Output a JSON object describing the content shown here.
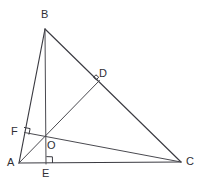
{
  "figure": {
    "canvas": {
      "width": 206,
      "height": 186,
      "background": "#ffffff"
    },
    "stroke_color": "#3b3b42",
    "label_color": "#2f2f35",
    "points": {
      "A": {
        "label": "A",
        "x": 19,
        "y": 163,
        "label_x": 7,
        "label_y": 157
      },
      "B": {
        "label": "B",
        "x": 45,
        "y": 29,
        "label_x": 41,
        "label_y": 9
      },
      "C": {
        "label": "C",
        "x": 181,
        "y": 162,
        "label_x": 186,
        "label_y": 156
      },
      "D": {
        "label": "D",
        "x": 99,
        "y": 81,
        "label_x": 99,
        "label_y": 68
      },
      "E": {
        "label": "E",
        "x": 46,
        "y": 163,
        "label_x": 42,
        "label_y": 168
      },
      "F": {
        "label": "F",
        "x": 25,
        "y": 133,
        "label_x": 11,
        "label_y": 126
      },
      "O": {
        "label": "O",
        "x": 46,
        "y": 137,
        "label_x": 47,
        "label_y": 140
      }
    },
    "segments": [
      {
        "name": "side-ab",
        "from": "A",
        "to": "B"
      },
      {
        "name": "side-bc",
        "from": "B",
        "to": "C"
      },
      {
        "name": "side-ac",
        "from": "A",
        "to": "C"
      },
      {
        "name": "altitude-be",
        "from": "B",
        "to": "E"
      },
      {
        "name": "altitude-ad",
        "from": "A",
        "to": "D"
      },
      {
        "name": "altitude-cf",
        "from": "C",
        "to": "F"
      }
    ],
    "right_angles": [
      {
        "name": "right-angle-at-d",
        "vertex": "D"
      },
      {
        "name": "right-angle-at-e",
        "vertex": "E"
      },
      {
        "name": "right-angle-at-f",
        "vertex": "F"
      }
    ]
  }
}
